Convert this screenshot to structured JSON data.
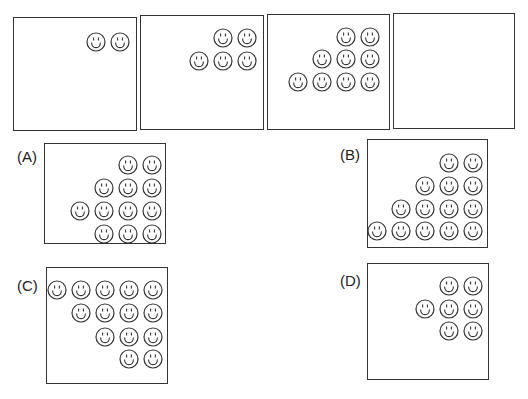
{
  "puzzle": {
    "sequence_panels": [
      {
        "id": "panel-1",
        "faces": [
          [
            96,
            42
          ],
          [
            120,
            42
          ]
        ]
      },
      {
        "id": "panel-2",
        "faces": [
          [
            223,
            38
          ],
          [
            247,
            38
          ],
          [
            199,
            61
          ],
          [
            223,
            61
          ],
          [
            247,
            61
          ]
        ]
      },
      {
        "id": "panel-3",
        "faces": [
          [
            346,
            37
          ],
          [
            370,
            37
          ],
          [
            322,
            59
          ],
          [
            346,
            59
          ],
          [
            370,
            59
          ],
          [
            298,
            82
          ],
          [
            322,
            82
          ],
          [
            346,
            82
          ],
          [
            370,
            82
          ]
        ]
      },
      {
        "id": "panel-4",
        "faces": []
      }
    ],
    "options": [
      {
        "label": "(A)",
        "faces": [
          [
            128,
            165
          ],
          [
            152,
            165
          ],
          [
            104,
            188
          ],
          [
            128,
            188
          ],
          [
            152,
            188
          ],
          [
            80,
            211
          ],
          [
            104,
            211
          ],
          [
            128,
            211
          ],
          [
            152,
            211
          ],
          [
            104,
            234
          ],
          [
            128,
            234
          ],
          [
            152,
            234
          ]
        ]
      },
      {
        "label": "(B)",
        "faces": [
          [
            449,
            163
          ],
          [
            473,
            163
          ],
          [
            425,
            186
          ],
          [
            449,
            186
          ],
          [
            473,
            186
          ],
          [
            401,
            209
          ],
          [
            425,
            209
          ],
          [
            449,
            209
          ],
          [
            473,
            209
          ],
          [
            377,
            231
          ],
          [
            401,
            231
          ],
          [
            425,
            231
          ],
          [
            449,
            231
          ],
          [
            473,
            231
          ]
        ]
      },
      {
        "label": "(C)",
        "faces": [
          [
            57,
            290
          ],
          [
            81,
            290
          ],
          [
            105,
            290
          ],
          [
            129,
            290
          ],
          [
            153,
            290
          ],
          [
            81,
            313
          ],
          [
            105,
            313
          ],
          [
            129,
            313
          ],
          [
            153,
            313
          ],
          [
            105,
            337
          ],
          [
            129,
            337
          ],
          [
            153,
            337
          ],
          [
            129,
            359
          ],
          [
            153,
            359
          ]
        ]
      },
      {
        "label": "(D)",
        "faces": [
          [
            449,
            286
          ],
          [
            473,
            286
          ],
          [
            425,
            309
          ],
          [
            449,
            309
          ],
          [
            473,
            309
          ],
          [
            449,
            331
          ],
          [
            473,
            331
          ]
        ]
      }
    ],
    "icon": "smiley-face-icon",
    "stroke_color": "#333333"
  }
}
